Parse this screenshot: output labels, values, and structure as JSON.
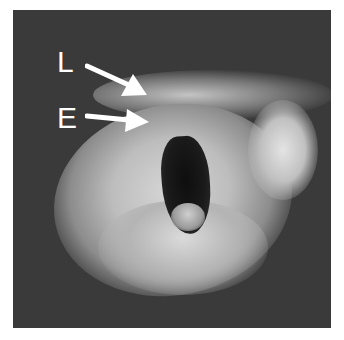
{
  "figure": {
    "labels": [
      {
        "text": "L",
        "arrow_direction": "down-right"
      },
      {
        "text": "E",
        "arrow_direction": "right"
      }
    ],
    "colors": {
      "background": "#3a3a3a",
      "label": "#ffffff",
      "frame": "#ffffff"
    }
  }
}
